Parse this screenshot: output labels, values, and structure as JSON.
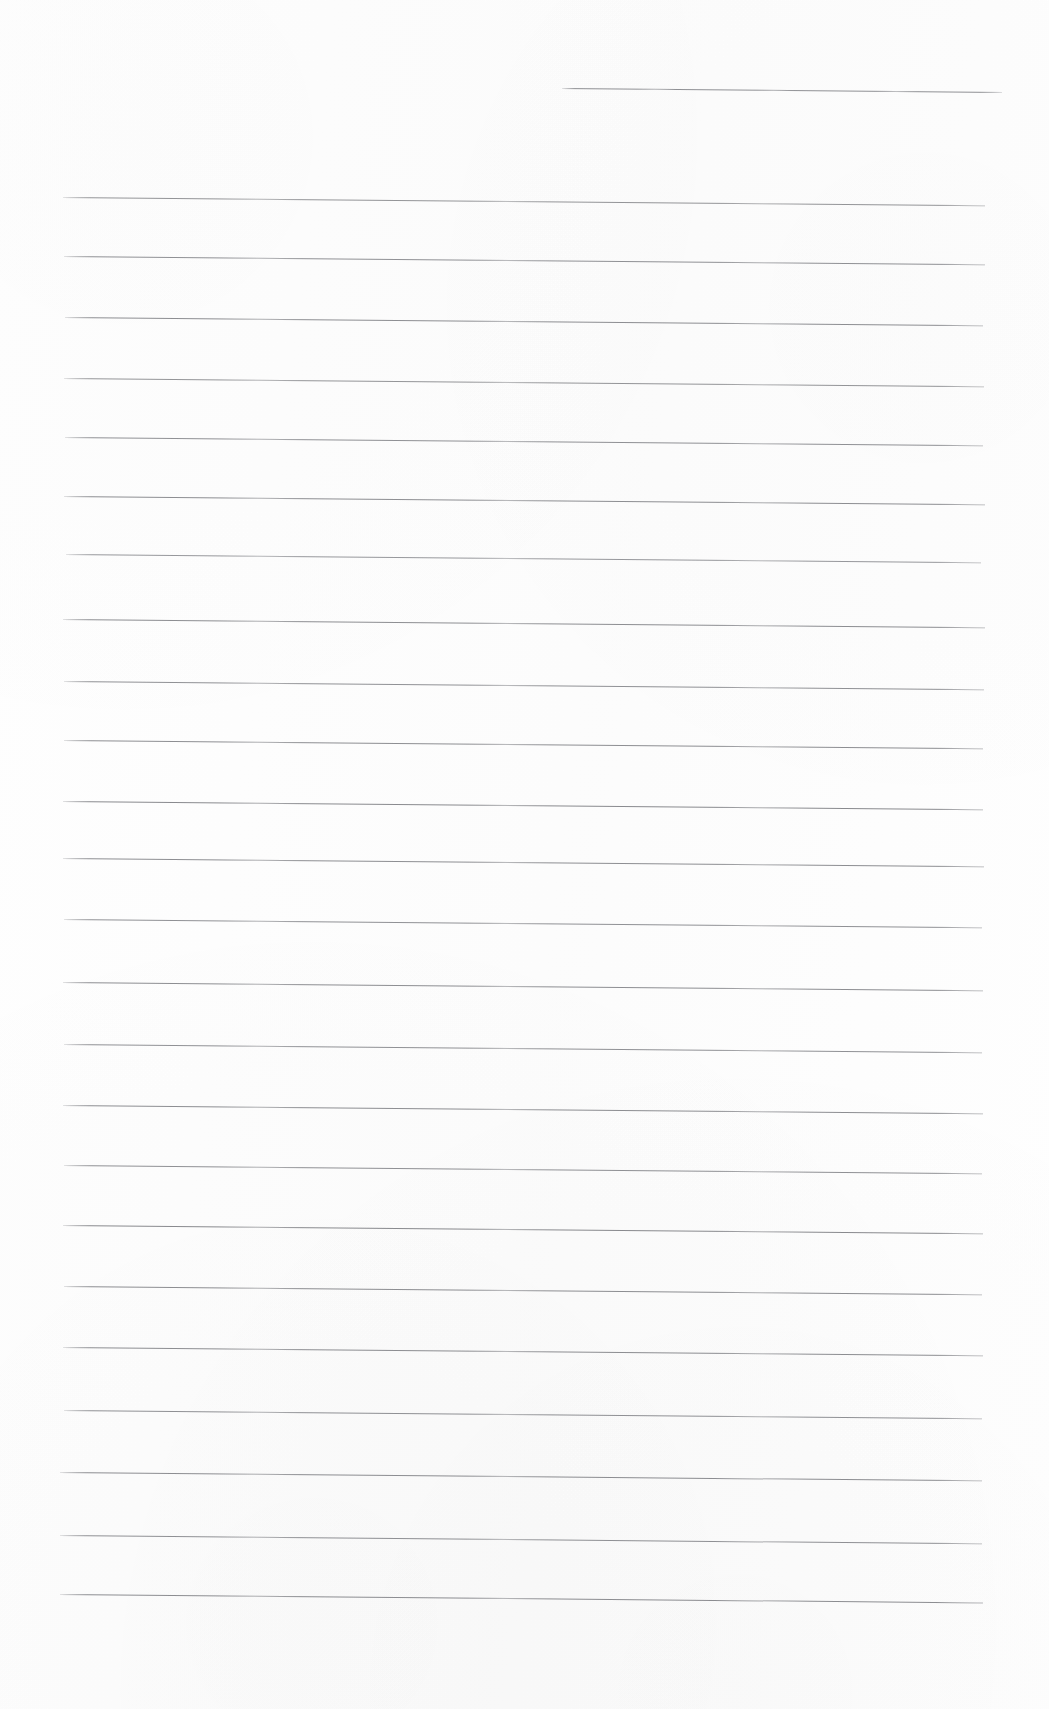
{
  "document": {
    "kind": "lined-paper-scan",
    "title": "Blank ruled notebook page",
    "orientation": "portrait",
    "page_width_px": 1049,
    "page_height_px": 1709,
    "paper_color": "#fefefe",
    "rule_color": "#484a50",
    "rule_thickness_px": 1,
    "has_margin_rule": false,
    "has_header_text": false,
    "has_handwriting": false,
    "visible_text": ""
  },
  "ruling": {
    "line_count": 23,
    "full_width_line_count": 22,
    "partial_line_count": 1,
    "average_spacing_px": 65.3,
    "skew_degrees": 0.52,
    "left_margin_px": 62,
    "right_margin_px": 985,
    "first_full_line_y_px": 211,
    "last_line_y_px": 1594,
    "lines": [
      {
        "index": 1,
        "x": 562,
        "y": 88,
        "width": 440,
        "opacity": 0.6,
        "note": "partial top line, right half only"
      },
      {
        "index": 2,
        "x": 63,
        "y": 197,
        "width": 922,
        "opacity": 0.58
      },
      {
        "index": 3,
        "x": 64,
        "y": 256,
        "width": 921,
        "opacity": 0.6
      },
      {
        "index": 4,
        "x": 65,
        "y": 317,
        "width": 918,
        "opacity": 0.62
      },
      {
        "index": 5,
        "x": 64,
        "y": 378,
        "width": 920,
        "opacity": 0.58
      },
      {
        "index": 6,
        "x": 65,
        "y": 437,
        "width": 918,
        "opacity": 0.6
      },
      {
        "index": 7,
        "x": 64,
        "y": 496,
        "width": 921,
        "opacity": 0.62
      },
      {
        "index": 8,
        "x": 66,
        "y": 554,
        "width": 915,
        "opacity": 0.56
      },
      {
        "index": 9,
        "x": 63,
        "y": 619,
        "width": 922,
        "opacity": 0.62
      },
      {
        "index": 10,
        "x": 64,
        "y": 681,
        "width": 920,
        "opacity": 0.6
      },
      {
        "index": 11,
        "x": 64,
        "y": 740,
        "width": 919,
        "opacity": 0.62
      },
      {
        "index": 12,
        "x": 63,
        "y": 801,
        "width": 920,
        "opacity": 0.64
      },
      {
        "index": 13,
        "x": 63,
        "y": 858,
        "width": 921,
        "opacity": 0.62
      },
      {
        "index": 14,
        "x": 64,
        "y": 919,
        "width": 918,
        "opacity": 0.6
      },
      {
        "index": 15,
        "x": 63,
        "y": 982,
        "width": 920,
        "opacity": 0.62
      },
      {
        "index": 16,
        "x": 64,
        "y": 1044,
        "width": 918,
        "opacity": 0.6
      },
      {
        "index": 17,
        "x": 63,
        "y": 1105,
        "width": 920,
        "opacity": 0.62
      },
      {
        "index": 18,
        "x": 64,
        "y": 1165,
        "width": 918,
        "opacity": 0.6
      },
      {
        "index": 19,
        "x": 63,
        "y": 1225,
        "width": 920,
        "opacity": 0.64
      },
      {
        "index": 20,
        "x": 64,
        "y": 1286,
        "width": 918,
        "opacity": 0.62
      },
      {
        "index": 21,
        "x": 63,
        "y": 1347,
        "width": 920,
        "opacity": 0.62
      },
      {
        "index": 22,
        "x": 64,
        "y": 1410,
        "width": 918,
        "opacity": 0.6
      },
      {
        "index": 23,
        "x": 60,
        "y": 1472,
        "width": 922,
        "opacity": 0.62
      },
      {
        "index": 24,
        "x": 60,
        "y": 1535,
        "width": 922,
        "opacity": 0.6
      },
      {
        "index": 25,
        "x": 60,
        "y": 1594,
        "width": 923,
        "opacity": 0.62
      }
    ]
  }
}
